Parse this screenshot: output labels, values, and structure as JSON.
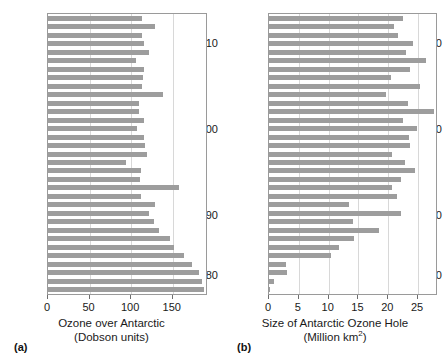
{
  "figure": {
    "panels": [
      {
        "caption": "(a)",
        "axis_title_line1": "Ozone over Antarctic",
        "axis_title_line2": "(Dobson units)"
      },
      {
        "caption": "(b)",
        "axis_title_line1": "Size of Antarctic Ozone Hole",
        "axis_title_line2_pre": "(Million km",
        "axis_title_line2_sup": "2",
        "axis_title_line2_post": ")"
      }
    ],
    "year_labels": [
      "2010",
      "2000",
      "1990",
      "1980"
    ]
  },
  "chart_data": [
    {
      "type": "bar",
      "orientation": "horizontal",
      "title": "",
      "xlabel": "Ozone over Antarctic (Dobson units)",
      "ylabel": "",
      "xlim": [
        0,
        190
      ],
      "ylim_years": [
        1979,
        2011
      ],
      "xticks": [
        0,
        50,
        100,
        150
      ],
      "xtick_labels": [
        "0",
        "50",
        "100",
        "150"
      ],
      "ytick_years": [
        1980,
        1990,
        2000,
        2010
      ],
      "grid": "vertical",
      "legend": "none",
      "bar_color": "#9d9d9d",
      "categories": [
        2011,
        2010,
        2009,
        2008,
        2007,
        2006,
        2005,
        2004,
        2003,
        2002,
        2001,
        2000,
        1999,
        1998,
        1997,
        1996,
        1995,
        1994,
        1993,
        1992,
        1991,
        1990,
        1989,
        1988,
        1987,
        1986,
        1985,
        1984,
        1983,
        1982,
        1981,
        1980,
        1979
      ],
      "values": [
        113,
        129,
        113,
        115,
        122,
        106,
        115,
        114,
        113,
        138,
        110,
        110,
        116,
        107,
        115,
        117,
        119,
        94,
        112,
        111,
        157,
        112,
        129,
        121,
        127,
        133,
        147,
        152,
        163,
        173,
        181,
        185,
        187
      ]
    },
    {
      "type": "bar",
      "orientation": "horizontal",
      "title": "",
      "xlabel": "Size of Antarctic Ozone Hole (Million km2)",
      "ylabel": "",
      "xlim": [
        0,
        28
      ],
      "ylim_years": [
        1979,
        2011
      ],
      "xticks": [
        0,
        5,
        10,
        15,
        20,
        25
      ],
      "xtick_labels": [
        "0",
        "5",
        "10",
        "15",
        "20",
        "25"
      ],
      "ytick_years": [
        1980,
        1990,
        2000,
        2010
      ],
      "grid": "vertical",
      "legend": "none",
      "bar_color": "#9d9d9d",
      "categories": [
        2011,
        2010,
        2009,
        2008,
        2007,
        2006,
        2005,
        2004,
        2003,
        2002,
        2001,
        2000,
        1999,
        1998,
        1997,
        1996,
        1995,
        1994,
        1993,
        1992,
        1991,
        1990,
        1989,
        1988,
        1987,
        1986,
        1985,
        1984,
        1983,
        1982,
        1981,
        1980,
        1979
      ],
      "values": [
        22.5,
        20.9,
        21.6,
        24.1,
        23.0,
        26.3,
        23.7,
        20.4,
        25.3,
        19.6,
        23.3,
        27.7,
        22.4,
        24.8,
        23.4,
        23.7,
        20.6,
        22.8,
        24.5,
        22.2,
        20.7,
        21.4,
        13.4,
        22.1,
        14.0,
        18.4,
        14.2,
        11.8,
        10.4,
        2.8,
        3.0,
        0.9,
        0.1
      ]
    }
  ]
}
